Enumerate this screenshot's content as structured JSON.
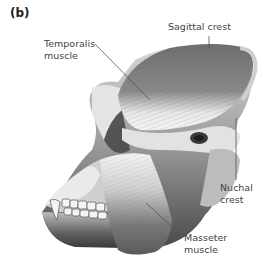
{
  "figure": {
    "panel_label": "(b)"
  },
  "labels": {
    "sagittal_crest": "Sagittal crest",
    "temporalis_line1": "Temporalis",
    "temporalis_line2": "muscle",
    "nuchal_line1": "Nuchal",
    "nuchal_line2": "crest",
    "masseter_line1": "Masseter",
    "masseter_line2": "muscle"
  },
  "colors": {
    "background": "#ffffff",
    "bone_light": "#e6e6e6",
    "bone_mid": "#a8a8a8",
    "bone_dark": "#3c3c3c",
    "muscle": "#7d7d7d",
    "leader_line": "#555555"
  }
}
